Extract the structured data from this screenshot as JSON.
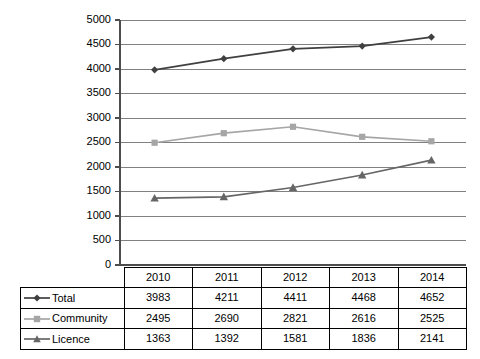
{
  "chart_data": {
    "type": "line",
    "title": "",
    "xlabel": "",
    "ylabel": "",
    "categories": [
      "2010",
      "2011",
      "2012",
      "2013",
      "2014"
    ],
    "ylim": [
      0,
      5000
    ],
    "ytick_step": 500,
    "yticks": [
      "0",
      "500",
      "1000",
      "1500",
      "2000",
      "2500",
      "3000",
      "3500",
      "4000",
      "4500",
      "5000"
    ],
    "grid": true,
    "legend_position": "table-left-column",
    "series": [
      {
        "name": "Total",
        "marker": "diamond",
        "color": "#404040",
        "values": [
          3983,
          4211,
          4411,
          4468,
          4652
        ]
      },
      {
        "name": "Community",
        "marker": "square",
        "color": "#a6a6a6",
        "values": [
          2495,
          2690,
          2821,
          2616,
          2525
        ]
      },
      {
        "name": "Licence",
        "marker": "triangle",
        "color": "#666666",
        "values": [
          1363,
          1392,
          1581,
          1836,
          2141
        ]
      }
    ]
  },
  "table": {
    "corner_label": "",
    "column_headers": [
      "2010",
      "2011",
      "2012",
      "2013",
      "2014"
    ],
    "rows": [
      {
        "label": "Total",
        "marker": "diamond",
        "color": "#404040",
        "cells": [
          "3983",
          "4211",
          "4411",
          "4468",
          "4652"
        ]
      },
      {
        "label": "Community",
        "marker": "square",
        "color": "#a6a6a6",
        "cells": [
          "2495",
          "2690",
          "2821",
          "2616",
          "2525"
        ]
      },
      {
        "label": "Licence",
        "marker": "triangle",
        "color": "#666666",
        "cells": [
          "1363",
          "1392",
          "1581",
          "1836",
          "2141"
        ]
      }
    ]
  },
  "colors": {
    "total": "#404040",
    "community": "#a6a6a6",
    "licence": "#666666",
    "gridline": "#808080",
    "axis": "#4d4d4d",
    "text": "#000000",
    "background": "#ffffff"
  }
}
